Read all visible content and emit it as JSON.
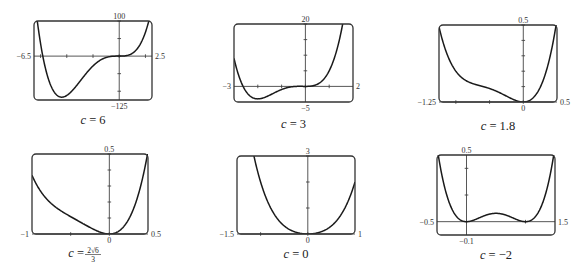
{
  "chart_data": [
    {
      "type": "line",
      "function": "f(x) = x^4 + c*x^3 + x^2",
      "c": 6,
      "caption_var": "c",
      "caption_value": "6",
      "xlim": [
        -6.5,
        2.5
      ],
      "ylim": [
        -125,
        100
      ],
      "x_ticks": [
        -6,
        -4,
        -2,
        0,
        2
      ],
      "y_ticks": [
        -100,
        -50,
        0,
        50,
        100
      ],
      "labels": {
        "xmin": "−6.5",
        "xmax": "2.5",
        "ymin": "−125",
        "ymax": "100"
      },
      "axis_y_at": 0,
      "series": [
        {
          "name": "f",
          "x": [
            -6.5,
            -6,
            -5,
            -4.386,
            -4,
            -3,
            -2,
            -1,
            0,
            1,
            2,
            2.5
          ],
          "y": [
            -78.3,
            0,
            -100,
            -117,
            -112,
            -72,
            -28,
            -4,
            0,
            8,
            68,
            132.8
          ]
        }
      ],
      "grid": false
    },
    {
      "type": "line",
      "function": "f(x) = x^4 + c*x^3 + x^2",
      "c": 3,
      "caption_var": "c",
      "caption_value": "3",
      "xlim": [
        -3,
        2
      ],
      "ylim": [
        -5,
        20
      ],
      "x_ticks": [
        -2,
        -1,
        0,
        1
      ],
      "y_ticks": [
        5,
        10,
        15,
        20
      ],
      "labels": {
        "xmin": "−3",
        "xmax": "2",
        "ymin": "−5",
        "ymax": "20"
      },
      "series": [
        {
          "name": "f",
          "x": [
            -3,
            -2.5,
            -2,
            -1.5,
            -1,
            -0.5,
            0,
            0.5,
            1,
            1.5,
            2
          ],
          "y": [
            9,
            -0.7,
            -4,
            -2.8,
            -1,
            -0.06,
            0,
            0.69,
            5,
            17.4,
            44
          ]
        }
      ],
      "grid": false
    },
    {
      "type": "line",
      "function": "f(x) = x^4 + c*x^3 + x^2",
      "c": 1.8,
      "caption_var": "c",
      "caption_value": "1.8",
      "xlim": [
        -1.25,
        0.5
      ],
      "ylim": [
        0,
        0.5
      ],
      "x_ticks": [
        -1,
        -0.5,
        0
      ],
      "y_ticks": [
        0.1,
        0.2,
        0.3,
        0.4,
        0.5
      ],
      "labels": {
        "xmin": "−1.25",
        "xmax": "0.5",
        "ymin": "0",
        "ymax": "0.5"
      },
      "series": [
        {
          "name": "f",
          "x": [
            -1.25,
            -1,
            -0.75,
            -0.5,
            -0.25,
            0,
            0.25,
            0.5
          ],
          "y": [
            0.56,
            0.2,
            0.17,
            0.09,
            0.04,
            0,
            0.09,
            0.54
          ]
        }
      ],
      "grid": false
    },
    {
      "type": "line",
      "function": "f(x) = x^4 + c*x^3 + x^2",
      "c": 1.633,
      "caption_var": "c",
      "caption_value_text": "2√6/3",
      "caption_num": "2√6",
      "caption_den": "3",
      "xlim": [
        -1,
        0.5
      ],
      "ylim": [
        0,
        0.5
      ],
      "x_ticks": [
        -0.5,
        0
      ],
      "y_ticks": [
        0.1,
        0.2,
        0.3,
        0.4,
        0.5
      ],
      "labels": {
        "xmin": "−1",
        "xmax": "0.5",
        "ymin": "0",
        "ymax": "0.5"
      },
      "series": [
        {
          "name": "f",
          "x": [
            -1,
            -0.75,
            -0.5,
            -0.25,
            0,
            0.25,
            0.5
          ],
          "y": [
            0.37,
            0.19,
            0.11,
            0.04,
            0,
            0.09,
            0.52
          ]
        }
      ],
      "grid": false
    },
    {
      "type": "line",
      "function": "f(x) = x^4 + c*x^3 + x^2",
      "c": 0,
      "caption_var": "c",
      "caption_value": "0",
      "xlim": [
        -1.5,
        1
      ],
      "ylim": [
        0,
        3
      ],
      "x_ticks": [
        -1,
        0
      ],
      "y_ticks": [
        1,
        2,
        3
      ],
      "labels": {
        "xmin": "−1.5",
        "xmax": "1",
        "ymin": "0",
        "ymax": "3"
      },
      "series": [
        {
          "name": "f",
          "x": [
            -1.5,
            -1,
            -0.5,
            0,
            0.5,
            1
          ],
          "y": [
            7.31,
            2,
            0.31,
            0,
            0.31,
            2
          ]
        }
      ],
      "grid": false
    },
    {
      "type": "line",
      "function": "f(x) = x^4 + c*x^3 + x^2",
      "c": -2,
      "caption_var": "c",
      "caption_value": "−2",
      "xlim": [
        -0.5,
        1.5
      ],
      "ylim": [
        -0.1,
        0.5
      ],
      "x_ticks": [
        0,
        1
      ],
      "y_ticks": [
        0.2,
        0.4
      ],
      "labels": {
        "xmin": "−0.5",
        "xmax": "1.5",
        "ymin": "−0.1",
        "ymax": "0.5"
      },
      "series": [
        {
          "name": "f",
          "x": [
            -0.5,
            0,
            0.5,
            1,
            1.5
          ],
          "y": [
            0.5625,
            0,
            0.0625,
            0,
            0.5625
          ]
        }
      ],
      "grid": false
    }
  ]
}
